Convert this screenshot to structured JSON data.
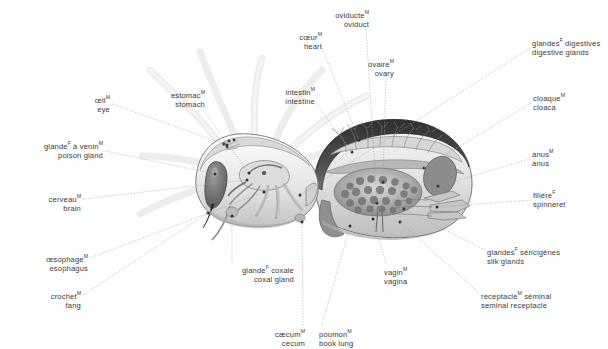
{
  "diagram": {
    "view": "lateral cutaway",
    "languages": [
      "French",
      "English"
    ],
    "background_color": "#ffffff",
    "text_color": "#3b3b3b",
    "leader_line_color": "#9a9a9a",
    "leader_line_style": "dotted",
    "art_palette": {
      "outline": "#4a4a4a",
      "cuticle_dark": "#3c3c3c",
      "body_light": "#efefef",
      "body_mid": "#c9c9c9",
      "body_shade": "#a8a8a8",
      "organ_dark": "#6f6f6f",
      "ghost_legs": "#f1f1f1"
    }
  },
  "labels": [
    {
      "id": "eye",
      "fr": "œil",
      "gender": "M",
      "en": "eye",
      "align": "right",
      "text_x": 110,
      "text_y": 93,
      "anchor": [
        112,
        104
      ],
      "target": [
        227,
        145
      ]
    },
    {
      "id": "poison-gland",
      "fr": "glande",
      "gender": "F",
      "fr_tail": " à venin",
      "gender2": "M",
      "en": "poison gland",
      "align": "right",
      "text_x": 103,
      "text_y": 139,
      "anchor": [
        105,
        151
      ],
      "target": [
        215,
        174
      ]
    },
    {
      "id": "brain",
      "fr": "cerveau",
      "gender": "M",
      "en": "brain",
      "align": "right",
      "text_x": 81,
      "text_y": 192,
      "anchor": [
        83,
        199
      ],
      "target": [
        247,
        180
      ]
    },
    {
      "id": "esophagus",
      "fr": "œsophage",
      "gender": "M",
      "en": "esophagus",
      "align": "right",
      "text_x": 88,
      "text_y": 252,
      "anchor": [
        90,
        258
      ],
      "target": [
        264,
        192
      ]
    },
    {
      "id": "fang",
      "fr": "crochet",
      "gender": "M",
      "en": "fang",
      "align": "right",
      "text_x": 81,
      "text_y": 289,
      "anchor": [
        83,
        295
      ],
      "target": [
        208,
        213
      ]
    },
    {
      "id": "stomach",
      "fr": "estomac",
      "gender": "M",
      "en": "stomach",
      "align": "right",
      "text_x": 205,
      "text_y": 88,
      "anchor": [
        200,
        106
      ],
      "target": [
        249,
        173
      ]
    },
    {
      "id": "heart",
      "fr": "cœur",
      "gender": "M",
      "en": "heart",
      "align": "right",
      "text_x": 322,
      "text_y": 30,
      "anchor": [
        322,
        48
      ],
      "target": [
        359,
        140
      ]
    },
    {
      "id": "intestine",
      "fr": "intestin",
      "gender": "M",
      "en": "intestine",
      "align": "right",
      "text_x": 315,
      "text_y": 85,
      "anchor": [
        316,
        103
      ],
      "target": [
        352,
        152
      ]
    },
    {
      "id": "oviduct",
      "fr": "oviducte",
      "gender": "M",
      "en": "oviduct",
      "align": "right",
      "text_x": 369,
      "text_y": 8,
      "anchor": [
        366,
        27
      ],
      "target": [
        377,
        203
      ]
    },
    {
      "id": "ovary",
      "fr": "ovaire",
      "gender": "M",
      "en": "ovary",
      "align": "right",
      "text_x": 394,
      "text_y": 57,
      "anchor": [
        386,
        76
      ],
      "target": [
        383,
        182
      ]
    },
    {
      "id": "digestive-glands",
      "fr": "glandes",
      "gender": "F",
      "fr_tail": " digestives",
      "en": "digestive glands",
      "align": "left",
      "text_x": 532,
      "text_y": 36,
      "anchor": [
        530,
        48
      ],
      "target": [
        300,
        195
      ]
    },
    {
      "id": "cloaca",
      "fr": "cloaque",
      "gender": "M",
      "en": "cloaca",
      "align": "left",
      "text_x": 533,
      "text_y": 91,
      "anchor": [
        531,
        103
      ],
      "target": [
        424,
        168
      ]
    },
    {
      "id": "anus",
      "fr": "anus",
      "gender": "M",
      "en": "anus",
      "align": "left",
      "text_x": 532,
      "text_y": 147,
      "anchor": [
        530,
        159
      ],
      "target": [
        438,
        186
      ]
    },
    {
      "id": "spinneret",
      "fr": "filière",
      "gender": "F",
      "en": "spinneret",
      "align": "left",
      "text_x": 533,
      "text_y": 188,
      "anchor": [
        531,
        200
      ],
      "target": [
        437,
        207
      ]
    },
    {
      "id": "silk-glands",
      "fr": "glandes",
      "gender": "F",
      "fr_tail": " séricigènes",
      "en": "silk glands",
      "align": "left",
      "text_x": 487,
      "text_y": 245,
      "anchor": [
        485,
        250
      ],
      "target": [
        404,
        209
      ]
    },
    {
      "id": "seminal-receptacle",
      "fr": "réceptacle",
      "gender": "M",
      "fr_tail": " séminal",
      "en": "seminal receptacle",
      "align": "left",
      "text_x": 481,
      "text_y": 289,
      "anchor": [
        479,
        293
      ],
      "target": [
        400,
        222
      ]
    },
    {
      "id": "coxal-gland",
      "fr": "glande",
      "gender": "F",
      "fr_tail": " coxale",
      "en": "coxal gland",
      "align": "right",
      "text_x": 294,
      "text_y": 263,
      "anchor": [
        232,
        262
      ],
      "target": [
        232,
        216
      ]
    },
    {
      "id": "cecum",
      "fr": "cæcum",
      "gender": "M",
      "en": "cecum",
      "align": "right",
      "text_x": 305,
      "text_y": 327,
      "anchor": [
        303,
        325
      ],
      "target": [
        302,
        222
      ]
    },
    {
      "id": "book-lung",
      "fr": "poumon",
      "gender": "M",
      "en": "book lung",
      "align": "left",
      "text_x": 319,
      "text_y": 327,
      "anchor": [
        322,
        325
      ],
      "target": [
        350,
        226
      ]
    },
    {
      "id": "vagina",
      "fr": "vagin",
      "gender": "M",
      "en": "vagina",
      "align": "left",
      "text_x": 384,
      "text_y": 265,
      "anchor": [
        386,
        263
      ],
      "target": [
        373,
        219
      ]
    }
  ]
}
